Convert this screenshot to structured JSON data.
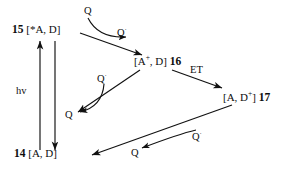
{
  "diagram": {
    "type": "reaction-scheme",
    "stroke_color": "#111111",
    "text_color": "#0d0d0d",
    "background": "#ffffff",
    "species": [
      {
        "id": "s15",
        "number": "15",
        "formula_open": "[*A, D]",
        "core": "*A, D",
        "charge": "",
        "position": {
          "x": 12,
          "y": 24
        }
      },
      {
        "id": "s16",
        "number": "16",
        "formula_open": "[A+, D]",
        "core": "A",
        "charge": "+",
        "tail": ", D]",
        "position": {
          "x": 134,
          "y": 56
        }
      },
      {
        "id": "s17",
        "number": "17",
        "formula_open": "[A, D+]",
        "core": "A, D",
        "charge": "+",
        "tail": "]",
        "position": {
          "x": 223,
          "y": 92
        }
      },
      {
        "id": "s14",
        "number": "14",
        "formula_open": "[A, D]",
        "core": "A, D",
        "charge": "",
        "position": {
          "x": 14,
          "y": 148
        }
      }
    ],
    "labels": {
      "hv": "hv",
      "et": "ET",
      "q_top": "Q",
      "q_top_radical": "Q",
      "q_top_radical_sup": "·",
      "q_mid_upper": "Q",
      "q_mid_upper_sup": "·",
      "q_mid_lower": "Q",
      "q_bottom_left": "Q",
      "q_bottom_right": "Q",
      "q_bottom_right_sup": "·"
    },
    "label_positions": {
      "hv": {
        "x": 16,
        "y": 86
      },
      "et": {
        "x": 190,
        "y": 65
      },
      "q_top": {
        "x": 84,
        "y": 6
      },
      "q_top_radical": {
        "x": 117,
        "y": 28
      },
      "q_mid_upper": {
        "x": 97,
        "y": 74
      },
      "q_mid_lower": {
        "x": 65,
        "y": 110
      },
      "q_bottom_left": {
        "x": 131,
        "y": 148
      },
      "q_bottom_right": {
        "x": 192,
        "y": 132
      }
    }
  }
}
